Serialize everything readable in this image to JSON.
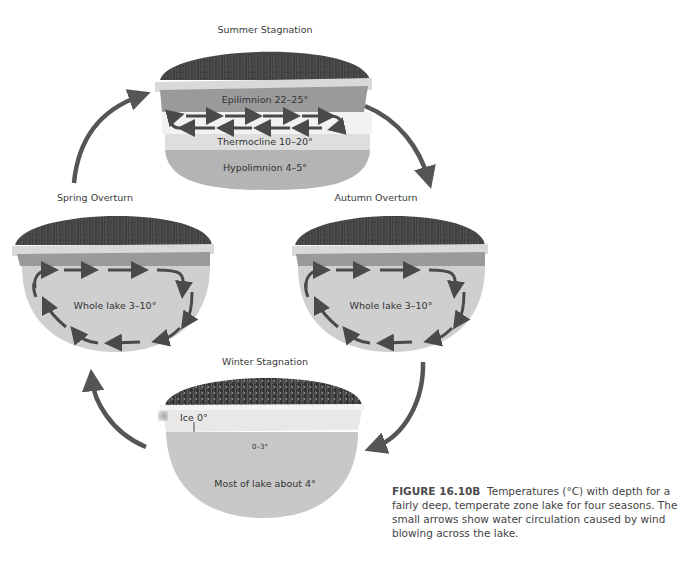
{
  "figure": {
    "id": "FIGURE 16.10B",
    "caption": "Temperatures (°C) with depth for a fairly deep, temperate zone lake for four seasons. The small arrows show water circulation caused by wind blowing across the lake."
  },
  "colors": {
    "grass": "#3c3c3c",
    "shore": "#d9d9d9",
    "epilimnion": "#9a9a9a",
    "thermocline": "#dedede",
    "hypolimnion": "#b4b4b4",
    "overturn_water": "#cfcfcf",
    "ice": "#e8e8e8",
    "winter_water": "#c8c8c8",
    "arrow": "#4a4a4a"
  },
  "panels": {
    "summer": {
      "title": "Summer Stagnation",
      "layers": [
        {
          "name": "Epilimnion",
          "label": "Epilimnion 22–25°"
        },
        {
          "name": "Thermocline",
          "label": "Thermocline 10–20°"
        },
        {
          "name": "Hypolimnion",
          "label": "Hypolimnion 4–5°"
        }
      ]
    },
    "autumn": {
      "title": "Autumn Overturn",
      "label": "Whole lake 3–10°"
    },
    "winter": {
      "title": "Winter Stagnation",
      "ice_label": "Ice 0°",
      "surface_label": "0–3°",
      "deep_label": "Most of lake about 4°"
    },
    "spring": {
      "title": "Spring Overturn",
      "label": "Whole lake 3–10°"
    }
  },
  "cycle_arrows": [
    "spring-to-summer",
    "summer-to-autumn",
    "autumn-to-winter",
    "winter-to-spring"
  ]
}
